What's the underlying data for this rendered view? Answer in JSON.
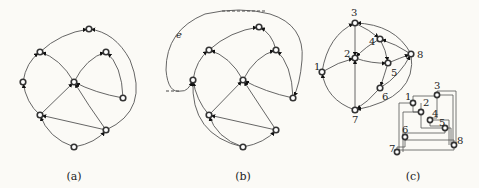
{
  "figure": {
    "panels": [
      {
        "id": "a",
        "caption": "(a)",
        "nodes": [
          {
            "id": "top",
            "x": 89,
            "y": 29
          },
          {
            "id": "ul",
            "x": 40,
            "y": 52
          },
          {
            "id": "ur",
            "x": 106,
            "y": 52
          },
          {
            "id": "l",
            "x": 23,
            "y": 82
          },
          {
            "id": "c",
            "x": 74,
            "y": 82
          },
          {
            "id": "r",
            "x": 123,
            "y": 98
          },
          {
            "id": "ll",
            "x": 40,
            "y": 115
          },
          {
            "id": "lr",
            "x": 106,
            "y": 130
          },
          {
            "id": "b",
            "x": 74,
            "y": 147
          }
        ],
        "edges": [
          [
            "ul",
            "top"
          ],
          [
            "lr",
            "top"
          ],
          [
            "l",
            "ul"
          ],
          [
            "c",
            "ul"
          ],
          [
            "c",
            "ur"
          ],
          [
            "r",
            "ur"
          ],
          [
            "ll",
            "l"
          ],
          [
            "ll",
            "c"
          ],
          [
            "r",
            "c"
          ],
          [
            "lr",
            "c"
          ],
          [
            "lr",
            "ll"
          ],
          [
            "b",
            "ll"
          ],
          [
            "b",
            "lr"
          ]
        ]
      },
      {
        "id": "b",
        "caption": "(b)",
        "edge_label": "e",
        "nodes": [
          {
            "id": "top",
            "x": 259,
            "y": 27
          },
          {
            "id": "ul",
            "x": 209,
            "y": 50
          },
          {
            "id": "ur",
            "x": 276,
            "y": 50
          },
          {
            "id": "l",
            "x": 193,
            "y": 80
          },
          {
            "id": "c",
            "x": 243,
            "y": 80
          },
          {
            "id": "r",
            "x": 293,
            "y": 98
          },
          {
            "id": "ll",
            "x": 209,
            "y": 115
          },
          {
            "id": "lr",
            "x": 276,
            "y": 130
          },
          {
            "id": "b",
            "x": 243,
            "y": 147
          }
        ],
        "edges": [
          [
            "ul",
            "top"
          ],
          [
            "r",
            "top"
          ],
          [
            "l",
            "ul"
          ],
          [
            "c",
            "ul"
          ],
          [
            "c",
            "ur"
          ],
          [
            "r",
            "ur"
          ],
          [
            "ll",
            "l"
          ],
          [
            "b",
            "l"
          ],
          [
            "ll",
            "c"
          ],
          [
            "r",
            "c"
          ],
          [
            "lr",
            "c"
          ],
          [
            "lr",
            "ll"
          ],
          [
            "b",
            "ll"
          ],
          [
            "b",
            "lr"
          ]
        ]
      },
      {
        "id": "c",
        "caption": "(c)",
        "nodes": [
          {
            "id": "1",
            "label": "1",
            "x": 322,
            "y": 72
          },
          {
            "id": "2",
            "label": "2",
            "x": 355,
            "y": 58
          },
          {
            "id": "3",
            "label": "3",
            "x": 355,
            "y": 23
          },
          {
            "id": "4",
            "label": "4",
            "x": 380,
            "y": 39
          },
          {
            "id": "5",
            "label": "5",
            "x": 388,
            "y": 63
          },
          {
            "id": "6",
            "label": "6",
            "x": 380,
            "y": 88
          },
          {
            "id": "7",
            "label": "7",
            "x": 355,
            "y": 110
          },
          {
            "id": "8",
            "label": "8",
            "x": 411,
            "y": 54
          }
        ],
        "edges": [
          [
            "1",
            "3"
          ],
          [
            "1",
            "2"
          ],
          [
            "7",
            "1"
          ],
          [
            "3",
            "2"
          ],
          [
            "3",
            "4"
          ],
          [
            "4",
            "2"
          ],
          [
            "8",
            "4"
          ],
          [
            "8",
            "3"
          ],
          [
            "2",
            "5"
          ],
          [
            "4",
            "5"
          ],
          [
            "5",
            "8"
          ],
          [
            "5",
            "6"
          ],
          [
            "6",
            "8"
          ],
          [
            "7",
            "2"
          ],
          [
            "6",
            "7"
          ],
          [
            "8",
            "7"
          ]
        ],
        "orthogonal_nodes": [
          {
            "label": "1",
            "x": 413,
            "y": 103
          },
          {
            "label": "2",
            "x": 421,
            "y": 112
          },
          {
            "label": "3",
            "x": 437,
            "y": 95
          },
          {
            "label": "4",
            "x": 430,
            "y": 120
          },
          {
            "label": "5",
            "x": 445,
            "y": 128
          },
          {
            "label": "6",
            "x": 405,
            "y": 137
          },
          {
            "label": "7",
            "x": 397,
            "y": 152
          },
          {
            "label": "8",
            "x": 454,
            "y": 145
          }
        ]
      }
    ]
  }
}
